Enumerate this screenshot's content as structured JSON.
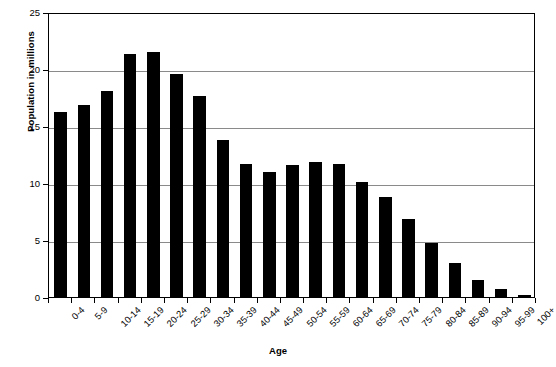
{
  "chart_data": {
    "type": "bar",
    "title": "",
    "xlabel": "Age",
    "ylabel": "Population in millions",
    "categories": [
      "0-4",
      "5-9",
      "10-14",
      "15-19",
      "20-24",
      "25-29",
      "30-34",
      "35-39",
      "40-44",
      "45-49",
      "50-54",
      "55-59",
      "60-64",
      "65-69",
      "70-74",
      "75-79",
      "80-84",
      "85-89",
      "90-94",
      "95-99",
      "100+"
    ],
    "values": [
      16.2,
      16.8,
      18.1,
      21.3,
      21.5,
      19.6,
      17.6,
      13.8,
      11.7,
      11.0,
      11.6,
      11.8,
      11.7,
      10.1,
      8.8,
      6.8,
      4.7,
      3.0,
      1.5,
      0.7,
      0.15
    ],
    "ylim": [
      0,
      25
    ],
    "yticks": [
      0,
      5,
      10,
      15,
      20,
      25
    ],
    "ytick_labels": [
      "0",
      "5",
      "10",
      "15",
      "20",
      "25"
    ],
    "grid": true,
    "grid_axis": "y",
    "legend": false,
    "bar_color": "#000000",
    "axis_color": "#000000",
    "grid_color": "#8a8a8a",
    "background": "#ffffff"
  }
}
